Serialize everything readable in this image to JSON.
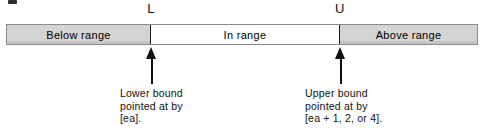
{
  "figure": {
    "type": "range-diagram",
    "artifact_mark": "ink-speck"
  },
  "bounds": {
    "lower_letter": "L",
    "upper_letter": "U"
  },
  "bar": {
    "segments": [
      {
        "id": "below",
        "label": "Below range",
        "fill": "#d4d4d4"
      },
      {
        "id": "in",
        "label": "In range",
        "fill": "#ffffff"
      },
      {
        "id": "above",
        "label": "Above range",
        "fill": "#d4d4d4"
      }
    ],
    "border_color": "#8a8a8a",
    "divider_color": "#1a1a1a"
  },
  "callouts": {
    "lower": {
      "line1": "Lower bound",
      "line2": "pointed at by",
      "line3": "[ea]."
    },
    "upper": {
      "line1": "Upper bound",
      "line2": "pointed at by",
      "line3": "[ea + 1, 2, or 4]."
    }
  },
  "icons": {
    "lower_arrow": "arrow-up-icon",
    "upper_arrow": "arrow-up-icon"
  }
}
